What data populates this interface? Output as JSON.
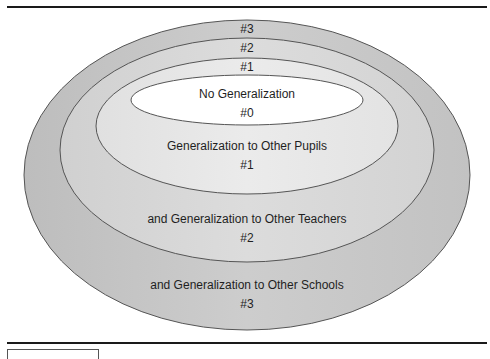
{
  "diagram": {
    "levels": [
      {
        "id": "level-3",
        "top_label": "#3",
        "description": "and Generalization to Other Schools",
        "bottom_label": "#3",
        "fill": "#c8c8c8"
      },
      {
        "id": "level-2",
        "top_label": "#2",
        "description": "and Generalization to Other Teachers",
        "bottom_label": "#2",
        "fill": "#d6d6d6"
      },
      {
        "id": "level-1",
        "top_label": "#1",
        "description": "Generalization to Other Pupils",
        "bottom_label": "#1",
        "fill": "#e4e4e4"
      },
      {
        "id": "level-0",
        "description": "No Generalization",
        "bottom_label": "#0",
        "fill": "#ffffff"
      }
    ],
    "stroke_color": "#555555"
  }
}
